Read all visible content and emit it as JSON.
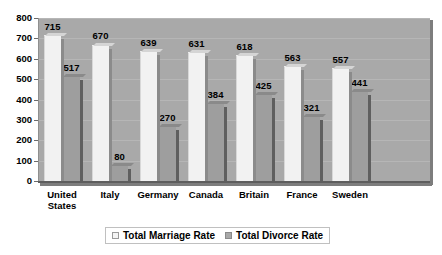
{
  "chart_data": {
    "type": "bar",
    "title": "",
    "subtitle": "",
    "xlabel": "",
    "ylabel": "",
    "categories": [
      "United\nStates",
      "Italy",
      "Germany",
      "Canada",
      "Britain",
      "France",
      "Sweden"
    ],
    "series": [
      {
        "name": "Total Marriage Rate",
        "color": "#f2f2f2",
        "values": [
          715,
          670,
          639,
          631,
          618,
          563,
          557
        ]
      },
      {
        "name": "Total Divorce Rate",
        "color": "#9e9e9e",
        "values": [
          517,
          80,
          270,
          384,
          425,
          321,
          441
        ]
      }
    ],
    "ylim": [
      0,
      800
    ],
    "ytick_step": 100,
    "yticks": [
      "0",
      "100",
      "200",
      "300",
      "400",
      "500",
      "600",
      "700",
      "800"
    ],
    "grid": true,
    "legend_position": "bottom",
    "plot_background": "#a9a9a9",
    "page_background": "#ffffff"
  }
}
